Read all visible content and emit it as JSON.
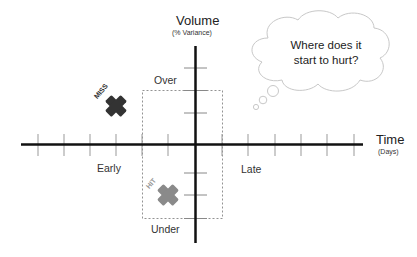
{
  "diagram": {
    "y_axis": {
      "title": "Volume",
      "subtitle": "(% Variance)",
      "top_label": "Over",
      "bottom_label": "Under"
    },
    "x_axis": {
      "title": "Time",
      "subtitle": "(Days)",
      "left_label": "Early",
      "right_label": "Late"
    },
    "thought_bubble": {
      "line1": "Where does it",
      "line2": "start to hurt?"
    },
    "markers": [
      {
        "label": "MISS",
        "color": "#333333",
        "quadrant": "early-over"
      },
      {
        "label": "HIT",
        "color": "#8a8a8a",
        "quadrant": "early-under, inside tolerance box"
      }
    ],
    "tolerance_box": {
      "style": "dashed",
      "color": "#777777"
    },
    "colors": {
      "axis": "#111111",
      "tick": "#999999",
      "cloud_stroke": "#c8c8c8",
      "miss": "#333333",
      "hit": "#8a8a8a"
    }
  }
}
